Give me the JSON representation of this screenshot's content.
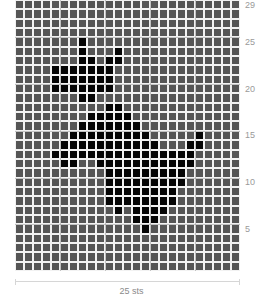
{
  "chart_data": {
    "type": "heatmap",
    "columns": 25,
    "rows": 29,
    "xlabel": "25 sts",
    "row_labels": [
      5,
      10,
      15,
      20,
      25,
      29
    ],
    "colors": {
      "background_stitch": "#555555",
      "contrast_stitch": "#050505",
      "grid": "#f2f2f2"
    },
    "filled_cells_by_row_from_top": {
      "4": [
        7
      ],
      "5": [
        7,
        11
      ],
      "6": [
        7,
        8,
        10,
        11
      ],
      "7": [
        4,
        5,
        6,
        7,
        8,
        9,
        10
      ],
      "8": [
        4,
        5,
        6,
        7,
        8,
        9,
        10
      ],
      "9": [
        4,
        5,
        6,
        7,
        8,
        9,
        10
      ],
      "10": [
        7,
        8
      ],
      "11": [
        10,
        11
      ],
      "12": [
        8,
        9,
        10,
        11,
        12
      ],
      "13": [
        7,
        8,
        9,
        10,
        11,
        12,
        13
      ],
      "14": [
        6,
        7,
        8,
        9,
        10,
        11,
        12,
        13,
        14,
        20
      ],
      "15": [
        5,
        6,
        7,
        8,
        9,
        10,
        11,
        12,
        13,
        14,
        15,
        19,
        20
      ],
      "16": [
        4,
        5,
        6,
        7,
        8,
        9,
        10,
        11,
        12,
        13,
        14,
        15,
        16,
        17,
        18,
        19
      ],
      "17": [
        5,
        6,
        9,
        10,
        11,
        12,
        13,
        14,
        15,
        16,
        17,
        18,
        19
      ],
      "18": [
        10,
        11,
        12,
        13,
        14,
        15,
        16,
        17,
        18
      ],
      "19": [
        10,
        11,
        12,
        13,
        14,
        15,
        16,
        17,
        18
      ],
      "20": [
        10,
        11,
        12,
        13,
        14,
        15,
        16,
        17
      ],
      "21": [
        10,
        11,
        12,
        13,
        14,
        15,
        16,
        17
      ],
      "22": [
        11,
        13,
        14,
        15,
        16
      ],
      "23": [
        13,
        14,
        15
      ],
      "24": [
        14
      ]
    }
  },
  "labels": {
    "row_29": "29",
    "row_25": "25",
    "row_20": "20",
    "row_15": "15",
    "row_10": "10",
    "row_5": "5",
    "stitch_count": "25 sts"
  }
}
